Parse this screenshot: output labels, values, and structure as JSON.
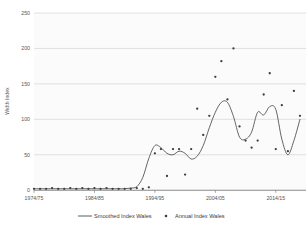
{
  "chart_data": {
    "type": "line",
    "title": "",
    "subtitle": "",
    "xlabel": "",
    "ylabel": "Width Index",
    "xlim": [
      1974,
      2019
    ],
    "ylim": [
      0,
      250
    ],
    "grid": true,
    "legend_position": "bottom",
    "y_ticks": [
      0,
      50,
      100,
      150,
      200,
      250
    ],
    "y_tick_labels": [
      "0",
      "50",
      "100",
      "150",
      "200",
      "250"
    ],
    "x_ticks": [
      1974,
      1984,
      1994,
      2004,
      2014
    ],
    "x_tick_labels": [
      "1974/75",
      "1984/85",
      "1994/95",
      "2004/05",
      "2014/15"
    ],
    "series": [
      {
        "name": "Smoothed Index Wales",
        "type": "line",
        "color": "#4a4a4a",
        "x": [
          1974,
          1975,
          1976,
          1977,
          1978,
          1979,
          1980,
          1981,
          1982,
          1983,
          1984,
          1985,
          1986,
          1987,
          1988,
          1989,
          1990,
          1991,
          1992,
          1993,
          1994,
          1995,
          1996,
          1997,
          1998,
          1999,
          2000,
          2001,
          2002,
          2003,
          2004,
          2005,
          2006,
          2007,
          2008,
          2009,
          2010,
          2011,
          2012,
          2013,
          2014,
          2015,
          2016,
          2017,
          2018
        ],
        "values": [
          2,
          2,
          2,
          2,
          2,
          2,
          2,
          2,
          2,
          2,
          2,
          2,
          2,
          2,
          2,
          2,
          3,
          5,
          18,
          45,
          63,
          60,
          52,
          50,
          55,
          52,
          44,
          48,
          63,
          88,
          110,
          124,
          124,
          104,
          75,
          72,
          82,
          110,
          106,
          118,
          114,
          72,
          50,
          70,
          100
        ]
      },
      {
        "name": "Annual Index Wales",
        "type": "scatter",
        "color": "#3d3d3d",
        "x": [
          1974,
          1975,
          1976,
          1977,
          1978,
          1979,
          1980,
          1981,
          1982,
          1983,
          1984,
          1985,
          1986,
          1987,
          1988,
          1989,
          1990,
          1991,
          1992,
          1993,
          1994,
          1995,
          1996,
          1997,
          1998,
          1999,
          2000,
          2001,
          2002,
          2003,
          2004,
          2005,
          2006,
          2007,
          2008,
          2009,
          2010,
          2011,
          2012,
          2013,
          2014,
          2015,
          2016,
          2017,
          2018
        ],
        "values": [
          2,
          2,
          2,
          3,
          2,
          2,
          3,
          2,
          3,
          2,
          3,
          2,
          3,
          2,
          2,
          2,
          2,
          3,
          2,
          4,
          52,
          58,
          20,
          58,
          58,
          22,
          58,
          115,
          78,
          105,
          160,
          182,
          128,
          200,
          90,
          70,
          60,
          70,
          135,
          165,
          58,
          120,
          55,
          140,
          105
        ]
      }
    ],
    "legend": [
      {
        "label": "Smoothed Index Wales",
        "marker": "line",
        "color": "#4a4a4a"
      },
      {
        "label": "Annual Index Wales",
        "marker": "dot",
        "color": "#3d3d3d"
      }
    ]
  }
}
